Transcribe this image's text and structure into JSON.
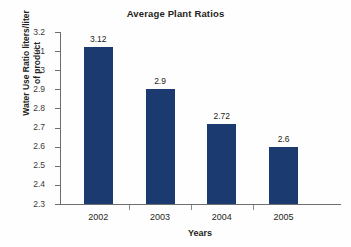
{
  "chart_data": {
    "type": "bar",
    "title": "Average Plant Ratios",
    "xlabel": "Years",
    "ylabel_line1": "Water Use Ratio liters/liter",
    "ylabel_line2": "of product",
    "categories": [
      "2002",
      "2003",
      "2004",
      "2005"
    ],
    "values": [
      3.12,
      2.9,
      2.72,
      2.6
    ],
    "value_labels": [
      "3.12",
      "2.9",
      "2.72",
      "2.6"
    ],
    "ylim": [
      2.3,
      3.2
    ],
    "ytick_labels": [
      "2.3",
      "2.4",
      "2.5",
      "2.6",
      "2.7",
      "2.8",
      "2.9",
      "3",
      "3.1",
      "3.2"
    ],
    "ytick_values": [
      2.3,
      2.4,
      2.5,
      2.6,
      2.7,
      2.8,
      2.9,
      3.0,
      3.1,
      3.2
    ],
    "grid": false,
    "legend": false,
    "bar_color": "#1b3a70",
    "axis_color": "#6d6e71",
    "text_color": "#231f20",
    "background": "#ffffff"
  }
}
